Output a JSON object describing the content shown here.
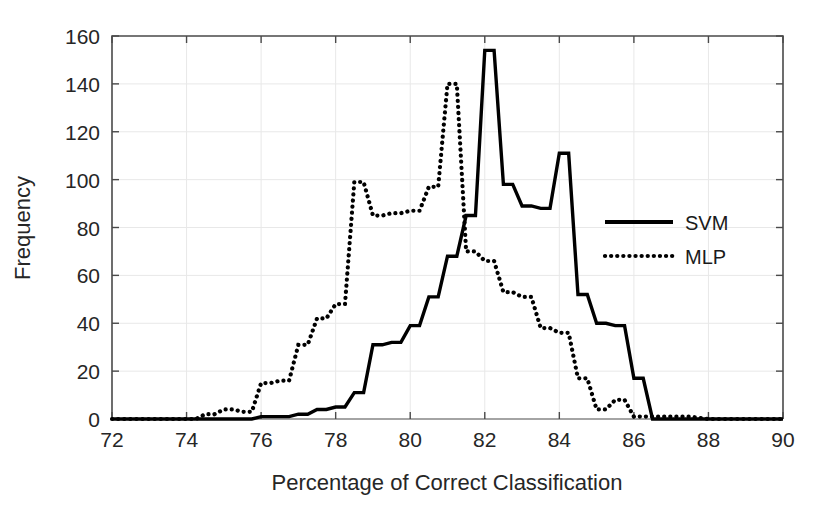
{
  "chart_data": {
    "type": "line",
    "title": "",
    "xlabel": "Percentage of Correct Classification",
    "ylabel": "Frequency",
    "xlim": [
      72,
      90
    ],
    "ylim": [
      0,
      160
    ],
    "xticks": [
      72,
      74,
      76,
      78,
      80,
      82,
      84,
      86,
      88,
      90
    ],
    "xtick_labels": [
      "72",
      "74",
      "76",
      "78",
      "80",
      "82",
      "84",
      "86",
      "88",
      "90"
    ],
    "yticks": [
      0,
      20,
      40,
      60,
      80,
      100,
      120,
      140,
      160
    ],
    "ytick_labels": [
      "0",
      "20",
      "40",
      "60",
      "80",
      "100",
      "120",
      "140",
      "160"
    ],
    "grid": true,
    "legend_position": "center-right",
    "bin_width": 0.25,
    "series": [
      {
        "name": "SVM",
        "style": "solid",
        "color": "#000000",
        "x": [
          72.0,
          72.25,
          72.5,
          72.75,
          73.0,
          73.25,
          73.5,
          73.75,
          74.0,
          74.25,
          74.5,
          74.75,
          75.0,
          75.25,
          75.5,
          75.75,
          76.0,
          76.25,
          76.5,
          76.75,
          77.0,
          77.25,
          77.5,
          77.75,
          78.0,
          78.25,
          78.5,
          78.75,
          79.0,
          79.25,
          79.5,
          79.75,
          80.0,
          80.25,
          80.5,
          80.75,
          81.0,
          81.25,
          81.5,
          81.75,
          82.0,
          82.25,
          82.5,
          82.75,
          83.0,
          83.25,
          83.5,
          83.75,
          84.0,
          84.25,
          84.5,
          84.75,
          85.0,
          85.25,
          85.5,
          85.75,
          86.0,
          86.25,
          86.5,
          86.75,
          87.0,
          87.5,
          88.0,
          88.5,
          89.0,
          89.5,
          90.0
        ],
        "values": [
          0,
          0,
          0,
          0,
          0,
          0,
          0,
          0,
          0,
          0,
          0,
          0,
          0,
          0,
          0,
          0,
          1,
          1,
          1,
          1,
          2,
          2,
          4,
          4,
          5,
          5,
          11,
          11,
          31,
          31,
          32,
          32,
          39,
          39,
          51,
          51,
          68,
          68,
          85,
          85,
          154,
          154,
          98,
          98,
          89,
          89,
          88,
          88,
          111,
          111,
          52,
          52,
          40,
          40,
          39,
          39,
          17,
          17,
          0,
          0,
          0,
          0,
          0,
          0,
          0,
          0,
          0
        ]
      },
      {
        "name": "MLP",
        "style": "dotted",
        "color": "#000000",
        "x": [
          72.0,
          72.25,
          72.5,
          72.75,
          73.0,
          73.25,
          73.5,
          73.75,
          74.0,
          74.25,
          74.5,
          74.75,
          75.0,
          75.25,
          75.5,
          75.75,
          76.0,
          76.25,
          76.5,
          76.75,
          77.0,
          77.25,
          77.5,
          77.75,
          78.0,
          78.25,
          78.5,
          78.75,
          79.0,
          79.25,
          79.5,
          79.75,
          80.0,
          80.25,
          80.5,
          80.75,
          81.0,
          81.25,
          81.5,
          81.75,
          82.0,
          82.25,
          82.5,
          82.75,
          83.0,
          83.25,
          83.5,
          83.75,
          84.0,
          84.25,
          84.5,
          84.75,
          85.0,
          85.25,
          85.5,
          85.75,
          86.0,
          86.5,
          87.0,
          87.5,
          88.0,
          88.5,
          89.0,
          89.5,
          90.0
        ],
        "values": [
          0,
          0,
          0,
          0,
          0,
          0,
          0,
          0,
          0,
          0,
          2,
          2,
          4,
          4,
          3,
          3,
          15,
          15,
          16,
          16,
          31,
          31,
          42,
          42,
          48,
          48,
          99,
          99,
          85,
          85,
          86,
          86,
          87,
          87,
          97,
          97,
          140,
          140,
          70,
          70,
          66,
          66,
          53,
          53,
          51,
          51,
          38,
          38,
          36,
          36,
          17,
          17,
          4,
          4,
          8,
          8,
          1,
          1,
          1,
          1,
          0,
          0,
          0,
          0,
          0
        ]
      }
    ]
  },
  "legend": {
    "entries": [
      {
        "label": "SVM",
        "style": "solid"
      },
      {
        "label": "MLP",
        "style": "dotted"
      }
    ]
  }
}
